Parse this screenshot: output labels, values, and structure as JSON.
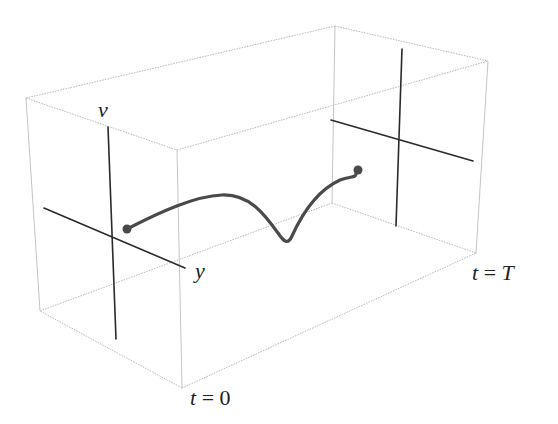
{
  "diagram": {
    "type": "3d-box-trajectory",
    "labels": {
      "v_axis": "v",
      "y_axis": "y",
      "t_start": "t = 0",
      "t_end": "t = T"
    },
    "colors": {
      "box_edges": "#b8b8b8",
      "axes": "#2a2a2a",
      "curve": "#4a4a4a",
      "background": "#ffffff"
    },
    "box": {
      "front_face": {
        "top_left": [
          26,
          98
        ],
        "top_right": [
          177,
          150
        ],
        "bottom_right": [
          182,
          388
        ],
        "bottom_left": [
          40,
          311
        ]
      },
      "back_face": {
        "top_left": [
          335,
          26
        ],
        "top_right": [
          488,
          61
        ],
        "bottom_right": [
          476,
          253
        ],
        "bottom_left": [
          332,
          203
        ]
      }
    },
    "front_axes": {
      "v": [
        [
          108,
          127
        ],
        [
          116,
          339
        ]
      ],
      "y": [
        [
          44,
          208
        ],
        [
          185,
          268
        ]
      ]
    },
    "back_axes": {
      "v": [
        [
          402,
          49
        ],
        [
          396,
          226
        ]
      ],
      "y": [
        [
          331,
          120
        ],
        [
          473,
          161
        ]
      ]
    },
    "trajectory": {
      "start_point": [
        127,
        229
      ],
      "end_point": [
        358,
        170
      ],
      "description": "smooth curve from t=0 plane to t=T plane with a dip"
    }
  }
}
